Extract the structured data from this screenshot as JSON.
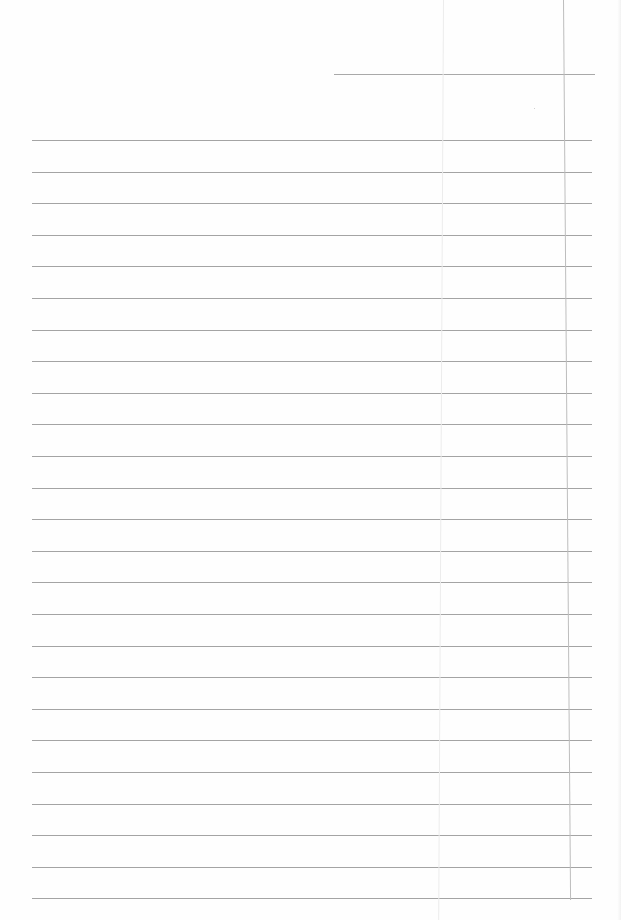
{
  "document": {
    "type": "lined-paper",
    "header_line": {
      "x": 334,
      "y": 74,
      "width": 261
    },
    "rules": {
      "count": 25,
      "first_y": 140,
      "spacing": 31.6,
      "left": 32,
      "width": 560,
      "color": "#a4a4a4"
    },
    "margin_line": {
      "x": 563,
      "color": "#bdbdbd"
    },
    "fold_line": {
      "x": 443,
      "color": "#ececec"
    },
    "paper_color": "#fefefe"
  }
}
